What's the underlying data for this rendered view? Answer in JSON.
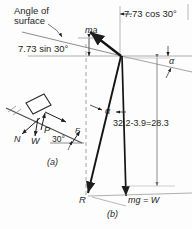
{
  "figure": {
    "title_note": "Angle of surface",
    "labels": {
      "angle_of_surface": "Angle of\nsurface",
      "angle_of_surface_line1": "Angle of",
      "angle_of_surface_line2": "surface",
      "sin_component": "7.73 sin 30°",
      "cos_component": "7.73 cos 30°",
      "ma_vector": "ma",
      "alpha_outer": "α",
      "alpha_inner": "α",
      "calculation": "32.2-3.9=28.3",
      "resultant": "R",
      "weight": "mg = W",
      "caption_a": "(a)",
      "caption_b": "(b)",
      "normal_force": "N",
      "weight_inset": "W",
      "applied_force": "P",
      "friction_force": "F",
      "incline_angle": "30°"
    },
    "colors": {
      "ink": "#1d1d1d",
      "thin_rule": "#8c8c8c",
      "dashed_rule": "#9a9a9a",
      "paper": "#fdfdfd"
    }
  }
}
